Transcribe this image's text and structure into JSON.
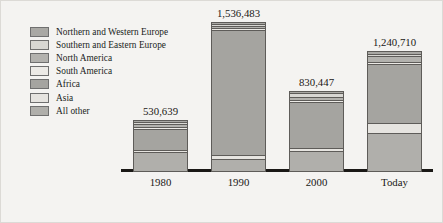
{
  "chart_data": {
    "type": "bar",
    "subtype": "stacked-bar",
    "title": "",
    "subtitle": "",
    "xlabel": "",
    "ylabel": "",
    "grid": false,
    "legend_position": "top-left",
    "categories": [
      "1980",
      "1990",
      "2000",
      "Today"
    ],
    "totals": [
      530639,
      1536483,
      830447,
      1240710
    ],
    "total_labels": [
      "530,639",
      "1,536,483",
      "830,447",
      "1,240,710"
    ],
    "ylim": [
      0,
      1536483
    ],
    "series": [
      {
        "name": "Northern and Western Europe",
        "color": "#a9a8a4",
        "values": [
          18000,
          17000,
          16000,
          33000
        ],
        "pcts": [
          3.4,
          1.1,
          1.9,
          2.7
        ]
      },
      {
        "name": "Southern and Eastern Europe",
        "color": "#d8d7d3",
        "values": [
          11000,
          12000,
          42000,
          22000
        ],
        "pcts": [
          2.1,
          0.8,
          5.1,
          1.8
        ]
      },
      {
        "name": "North America",
        "color": "#b3b2ae",
        "values": [
          30000,
          22000,
          30000,
          60000
        ],
        "pcts": [
          5.7,
          1.4,
          3.6,
          4.8
        ]
      },
      {
        "name": "South America",
        "color": "#eceae6",
        "values": [
          8000,
          12000,
          14000,
          18000
        ],
        "pcts": [
          1.5,
          0.8,
          1.7,
          1.5
        ]
      },
      {
        "name": "Africa",
        "color": "#a5a4a0",
        "values": [
          214000,
          1281000,
          470000,
          600000
        ],
        "pcts": [
          40.3,
          83.4,
          56.6,
          48.4
        ]
      },
      {
        "name": "Asia",
        "color": "#e6e4e0",
        "values": [
          21000,
          38000,
          33000,
          107000
        ],
        "pcts": [
          4.0,
          2.5,
          4.0,
          8.6
        ]
      },
      {
        "name": "All other",
        "color": "#b0afab",
        "values": [
          228639,
          154483,
          225447,
          400710
        ],
        "pcts": [
          43.0,
          10.0,
          27.1,
          32.2
        ]
      }
    ]
  },
  "legend": {
    "items": [
      {
        "label": "Northern and Western Europe",
        "color": "#a9a8a4"
      },
      {
        "label": "Southern and Eastern Europe",
        "color": "#d8d7d3"
      },
      {
        "label": "North America",
        "color": "#b3b2ae"
      },
      {
        "label": "South America",
        "color": "#eceae6"
      },
      {
        "label": "Africa",
        "color": "#a5a4a0"
      },
      {
        "label": "Asia",
        "color": "#e6e4e0"
      },
      {
        "label": "All other",
        "color": "#b0afab"
      }
    ]
  },
  "axis": {
    "baseline_color": "#1a1816"
  }
}
